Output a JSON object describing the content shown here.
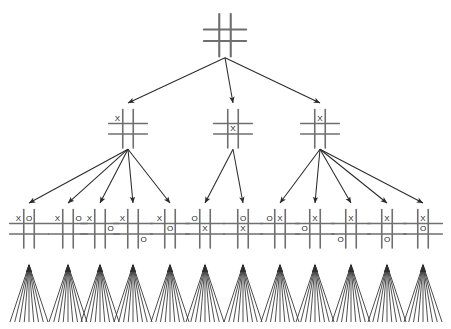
{
  "diagram": {
    "type": "game-tree",
    "colors": {
      "background": "#ffffff",
      "grid": "#6f6f6f",
      "edge": "#2b2b2b",
      "mark": "#1c1c1c",
      "fan": "#2f2f2f"
    },
    "mark_labels": {
      "x": "X",
      "o": "O",
      "empty": ""
    }
  },
  "levels": [
    {
      "name": "root",
      "depth": 0,
      "y": 18,
      "cell": 11.5,
      "font_size": 9,
      "nodes": [
        {
          "id": "root",
          "label": "empty-board",
          "x": 225,
          "cells": [
            "",
            "",
            "",
            "",
            "",
            "",
            "",
            "",
            ""
          ]
        }
      ]
    },
    {
      "name": "level-1",
      "depth": 1,
      "y": 113,
      "cell": 10.5,
      "font_size": 8,
      "nodes": [
        {
          "id": "n1-corner",
          "label": "x-top-left",
          "x": 128,
          "cells": [
            "X",
            "",
            "",
            "",
            "",
            "",
            "",
            "",
            ""
          ]
        },
        {
          "id": "n1-center",
          "label": "x-center",
          "x": 233,
          "cells": [
            "",
            "",
            "",
            "",
            "X",
            "",
            "",
            "",
            ""
          ]
        },
        {
          "id": "n1-edge",
          "label": "x-top-middle",
          "x": 320,
          "cells": [
            "",
            "X",
            "",
            "",
            "",
            "",
            "",
            "",
            ""
          ]
        }
      ]
    },
    {
      "name": "level-2",
      "depth": 2,
      "y": 213,
      "cell": 10.5,
      "font_size": 8,
      "nodes": [
        {
          "id": "n2-1",
          "label": "x-top-left-o-top-middle",
          "x": 29,
          "parent": "n1-corner",
          "cells": [
            "X",
            "O",
            "",
            "",
            "",
            "",
            "",
            "",
            ""
          ]
        },
        {
          "id": "n2-2",
          "label": "x-top-left-o-top-right",
          "x": 68,
          "parent": "n1-corner",
          "cells": [
            "X",
            "",
            "O",
            "",
            "",
            "",
            "",
            "",
            ""
          ]
        },
        {
          "id": "n2-3",
          "label": "x-top-left-o-middle-right",
          "x": 100,
          "parent": "n1-corner",
          "cells": [
            "X",
            "",
            "",
            "",
            "",
            "O",
            "",
            "",
            ""
          ]
        },
        {
          "id": "n2-4",
          "label": "x-top-left-o-bottom-right",
          "x": 133,
          "parent": "n1-corner",
          "cells": [
            "X",
            "",
            "",
            "",
            "",
            "",
            "",
            "",
            "O"
          ]
        },
        {
          "id": "n2-5",
          "label": "x-top-left-o-center",
          "x": 170,
          "parent": "n1-corner",
          "cells": [
            "X",
            "",
            "",
            "",
            "O",
            "",
            "",
            "",
            ""
          ]
        },
        {
          "id": "n2-6",
          "label": "o-top-left-x-center",
          "x": 205,
          "parent": "n1-center",
          "cells": [
            "O",
            "",
            "",
            "",
            "X",
            "",
            "",
            "",
            ""
          ]
        },
        {
          "id": "n2-7",
          "label": "o-top-middle-x-center",
          "x": 243,
          "parent": "n1-center",
          "cells": [
            "",
            "O",
            "",
            "",
            "X",
            "",
            "",
            "",
            ""
          ]
        },
        {
          "id": "n2-8",
          "label": "o-top-left-x-top-middle",
          "x": 280,
          "parent": "n1-edge",
          "cells": [
            "O",
            "X",
            "",
            "",
            "",
            "",
            "",
            "",
            ""
          ]
        },
        {
          "id": "n2-9",
          "label": "x-top-middle-o-middle-left",
          "x": 315,
          "parent": "n1-edge",
          "cells": [
            "",
            "X",
            "",
            "O",
            "",
            "",
            "",
            "",
            ""
          ]
        },
        {
          "id": "n2-10",
          "label": "x-top-middle-o-bottom-left",
          "x": 351,
          "parent": "n1-edge",
          "cells": [
            "",
            "X",
            "",
            "",
            "",
            "",
            "O",
            "",
            ""
          ]
        },
        {
          "id": "n2-11",
          "label": "x-top-middle-o-bottom-middle",
          "x": 387,
          "parent": "n1-edge",
          "cells": [
            "",
            "X",
            "",
            "",
            "",
            "",
            "",
            "O",
            ""
          ]
        },
        {
          "id": "n2-12",
          "label": "x-top-middle-o-center",
          "x": 423,
          "parent": "n1-edge",
          "cells": [
            "",
            "X",
            "",
            "",
            "O",
            "",
            "",
            "",
            ""
          ]
        }
      ]
    }
  ],
  "edges": [
    {
      "from": "root",
      "to": "n1-corner"
    },
    {
      "from": "root",
      "to": "n1-center"
    },
    {
      "from": "root",
      "to": "n1-edge"
    },
    {
      "from": "n1-corner",
      "to": "n2-1"
    },
    {
      "from": "n1-corner",
      "to": "n2-2"
    },
    {
      "from": "n1-corner",
      "to": "n2-3"
    },
    {
      "from": "n1-corner",
      "to": "n2-4"
    },
    {
      "from": "n1-corner",
      "to": "n2-5"
    },
    {
      "from": "n1-center",
      "to": "n2-6"
    },
    {
      "from": "n1-center",
      "to": "n2-7"
    },
    {
      "from": "n1-edge",
      "to": "n2-8"
    },
    {
      "from": "n1-edge",
      "to": "n2-9"
    },
    {
      "from": "n1-edge",
      "to": "n2-10"
    },
    {
      "from": "n1-edge",
      "to": "n2-11"
    },
    {
      "from": "n1-edge",
      "to": "n2-12"
    }
  ],
  "fans": {
    "count": 12,
    "rays_per_fan": 9,
    "top_y": 265,
    "bottom_y": 322,
    "half_width": 19,
    "x_positions": [
      29,
      68,
      100,
      133,
      170,
      205,
      243,
      280,
      315,
      351,
      387,
      423
    ]
  }
}
